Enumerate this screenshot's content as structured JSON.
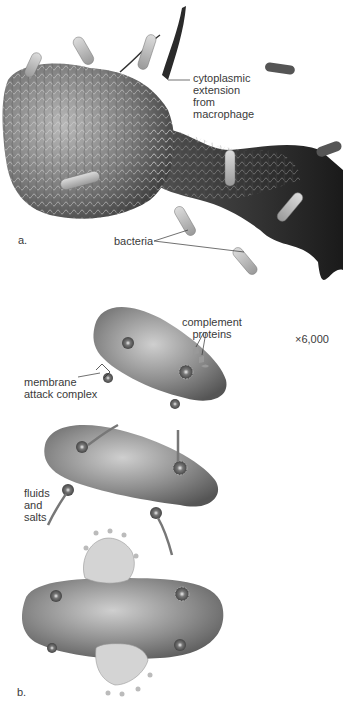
{
  "panel_a": {
    "label": "a.",
    "annotations": {
      "cytoplasmic_extension": [
        "cytoplasmic",
        "extension",
        "from",
        "macrophage"
      ],
      "bacteria": "bacteria"
    },
    "magnification": "×6,000"
  },
  "panel_b": {
    "label": "b.",
    "annotations": {
      "complement_proteins": [
        "complement",
        "proteins"
      ],
      "membrane_attack_complex": [
        "membrane",
        "attack complex"
      ],
      "fluids_and_salts": [
        "fluids",
        "and",
        "salts"
      ]
    }
  }
}
